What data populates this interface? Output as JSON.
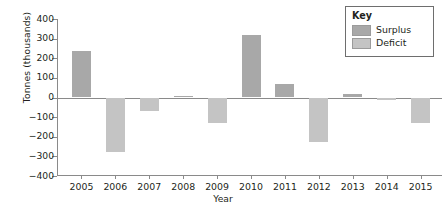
{
  "chart_data": {
    "type": "bar",
    "title": "",
    "xlabel": "Year",
    "ylabel": "Tonnes (thousands)",
    "categories": [
      "2005",
      "2006",
      "2007",
      "2008",
      "2009",
      "2010",
      "2011",
      "2012",
      "2013",
      "2014",
      "2015"
    ],
    "values": [
      235,
      -280,
      -70,
      10,
      -130,
      320,
      70,
      -225,
      18,
      -12,
      -130
    ],
    "ylim": [
      -400,
      400
    ],
    "yticks": [
      400,
      300,
      200,
      100,
      0,
      -100,
      -200,
      -300,
      -400
    ],
    "ytick_labels": [
      "400",
      "300",
      "200",
      "100",
      "0",
      "−100",
      "−200",
      "−300",
      "−400"
    ],
    "grid": false,
    "legend_position": "top-right",
    "series": [
      {
        "name": "Surplus",
        "color": "#a8a8a8",
        "rule": "positive values"
      },
      {
        "name": "Deficit",
        "color": "#c4c4c4",
        "rule": "negative values"
      }
    ]
  },
  "legend": {
    "title": "Key",
    "items": [
      {
        "label": "Surplus",
        "color": "#a8a8a8"
      },
      {
        "label": "Deficit",
        "color": "#c4c4c4"
      }
    ]
  },
  "colors": {
    "surplus": "#a8a8a8",
    "deficit": "#c4c4c4",
    "axis": "#8a8a8a",
    "text": "#231f20",
    "legend_border": "#6e6e6e",
    "background": "#ffffff"
  }
}
